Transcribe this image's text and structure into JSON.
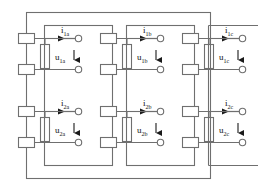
{
  "diagram": {
    "type": "electrical-schematic",
    "colors": {
      "line": "#6f6f6f",
      "line_dark": "#3a3a3a",
      "text": "#111111",
      "background": "#ffffff"
    },
    "outer_frame": {
      "name": "outer-frame"
    },
    "phases": [
      {
        "id": "a",
        "box_name": "phase-box-a",
        "ports": [
          {
            "current_symbol": "i",
            "current_sub": "1a",
            "voltage_symbol": "u",
            "voltage_sub": "1a",
            "current_arrow_dir": "left",
            "voltage_arrow_dir": "down"
          },
          {
            "current_symbol": "i",
            "current_sub": "2a",
            "voltage_symbol": "u",
            "voltage_sub": "2a",
            "current_arrow_dir": "left",
            "voltage_arrow_dir": "down"
          }
        ]
      },
      {
        "id": "b",
        "box_name": "phase-box-b",
        "ports": [
          {
            "current_symbol": "i",
            "current_sub": "1b",
            "voltage_symbol": "u",
            "voltage_sub": "1b",
            "current_arrow_dir": "left",
            "voltage_arrow_dir": "down"
          },
          {
            "current_symbol": "i",
            "current_sub": "2b",
            "voltage_symbol": "u",
            "voltage_sub": "2b",
            "current_arrow_dir": "left",
            "voltage_arrow_dir": "down"
          }
        ]
      },
      {
        "id": "c",
        "box_name": "phase-box-c",
        "ports": [
          {
            "current_symbol": "i",
            "current_sub": "1c",
            "voltage_symbol": "u",
            "voltage_sub": "1c",
            "current_arrow_dir": "left",
            "voltage_arrow_dir": "down"
          },
          {
            "current_symbol": "i",
            "current_sub": "2c",
            "voltage_symbol": "u",
            "voltage_sub": "2c",
            "current_arrow_dir": "left",
            "voltage_arrow_dir": "down"
          }
        ]
      }
    ]
  }
}
